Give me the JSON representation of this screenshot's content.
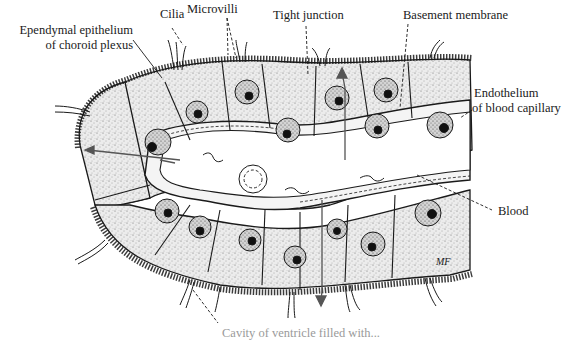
{
  "figure": {
    "labels": {
      "cilia": "Cilia",
      "microvilli": "Microvilli",
      "tight_junction": "Tight junction",
      "basement_membrane": "Basement membrane",
      "ependymal_line1": "Ependymal epithelium",
      "ependymal_line2": "of choroid  plexus",
      "endothelium_line1": "Endothelium",
      "endothelium_line2": "of blood capillary",
      "blood": "Blood",
      "bottom_clipped": "Cavity of ventricle filled with..."
    },
    "signature": "MF",
    "colors": {
      "ink": "#1a1a1a",
      "stipple": "#6a6a6a",
      "cell_fill": "#e9e9e9",
      "lumen": "#ffffff",
      "background": "#ffffff"
    }
  }
}
